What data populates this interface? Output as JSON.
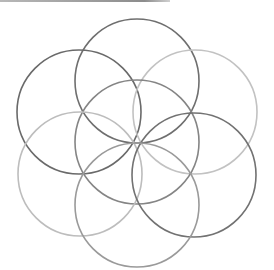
{
  "diagram": {
    "title": "",
    "type": "seed-of-life",
    "stroke_width": 1.6,
    "circles": [
      {
        "name": "top-circle",
        "cx": 137,
        "cy": 81,
        "r": 62,
        "color": "#6f6f6f"
      },
      {
        "name": "upper-left-circle",
        "cx": 79,
        "cy": 112,
        "r": 62,
        "color": "#6a6a6a"
      },
      {
        "name": "upper-right-circle",
        "cx": 195,
        "cy": 112,
        "r": 62,
        "color": "#c2c2c2"
      },
      {
        "name": "center-circle",
        "cx": 137,
        "cy": 142,
        "r": 62,
        "color": "#858585"
      },
      {
        "name": "lower-left-circle",
        "cx": 80,
        "cy": 174,
        "r": 62,
        "color": "#bdbdbd"
      },
      {
        "name": "lower-right-circle",
        "cx": 194,
        "cy": 175,
        "r": 62,
        "color": "#727272"
      },
      {
        "name": "bottom-circle",
        "cx": 137,
        "cy": 205,
        "r": 62,
        "color": "#9a9a9a"
      }
    ]
  }
}
